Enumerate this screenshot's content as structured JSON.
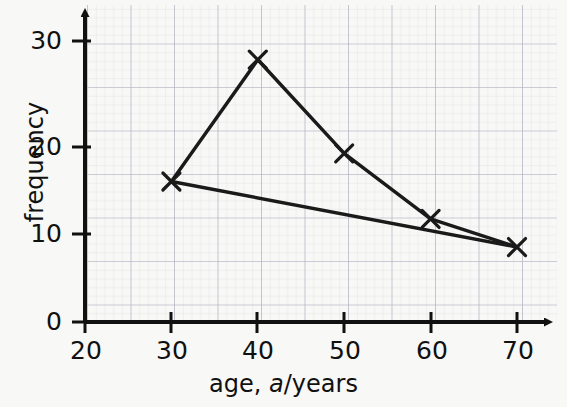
{
  "chart_data": {
    "type": "line",
    "title": "",
    "xlabel": "age, a/years",
    "xlabel_parts": {
      "prefix": "age, ",
      "italic": "a",
      "suffix": "/years"
    },
    "ylabel": "frequency",
    "xlim": [
      20,
      75
    ],
    "ylim": [
      0,
      34
    ],
    "xticks": [
      20,
      30,
      40,
      50,
      60,
      70
    ],
    "yticks": [
      0,
      10,
      20,
      30
    ],
    "xtick_labels": [
      "20",
      "30",
      "40",
      "50",
      "60",
      "70"
    ],
    "ytick_labels": [
      "0",
      "10",
      "20",
      "30"
    ],
    "grid": true,
    "grid_style": "graph-paper",
    "grid_minor_step_x": 2,
    "grid_minor_step_y": 1,
    "grid_major_step_x": 10,
    "grid_major_step_y": 5,
    "legend": "none",
    "marker": "x-cross",
    "series": [
      {
        "name": "frequency polygon",
        "x": [
          30,
          40,
          50,
          60,
          70
        ],
        "values": [
          15,
          28,
          18,
          11,
          8
        ],
        "color": "#1a1a1a",
        "marker": "x-cross"
      },
      {
        "name": "trend line",
        "x": [
          30,
          70
        ],
        "values": [
          15,
          8
        ],
        "color": "#1a1a1a",
        "marker": "none"
      }
    ],
    "annotations": []
  },
  "colors": {
    "page_background": "#f8f8f6",
    "axis": "#111111",
    "data_line": "#1a1a1a",
    "grid_minor": "#d8d8e2",
    "grid_major": "#a8a8b8",
    "text": "#111111"
  },
  "axes": {
    "x_axis_name": "horizontal-axis",
    "y_axis_name": "vertical-axis",
    "arrowheads": true
  }
}
